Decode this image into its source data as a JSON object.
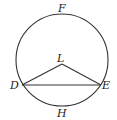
{
  "diagram": {
    "type": "circle-geometry",
    "circle": {
      "cx": 62,
      "cy": 60,
      "r": 46
    },
    "points": {
      "F": {
        "label": "F",
        "x": 62,
        "y": 14
      },
      "L": {
        "label": "L",
        "x": 62,
        "y": 64
      },
      "D": {
        "label": "D",
        "x": 22,
        "y": 85
      },
      "E": {
        "label": "E",
        "x": 101,
        "y": 85
      },
      "H": {
        "label": "H",
        "x": 62,
        "y": 106
      }
    },
    "segments": [
      [
        "D",
        "E"
      ],
      [
        "D",
        "L"
      ],
      [
        "L",
        "E"
      ]
    ],
    "labels": {
      "F": "F",
      "L": "L",
      "D": "D",
      "E": "E",
      "H": "H"
    },
    "stroke_color": "#333333"
  }
}
